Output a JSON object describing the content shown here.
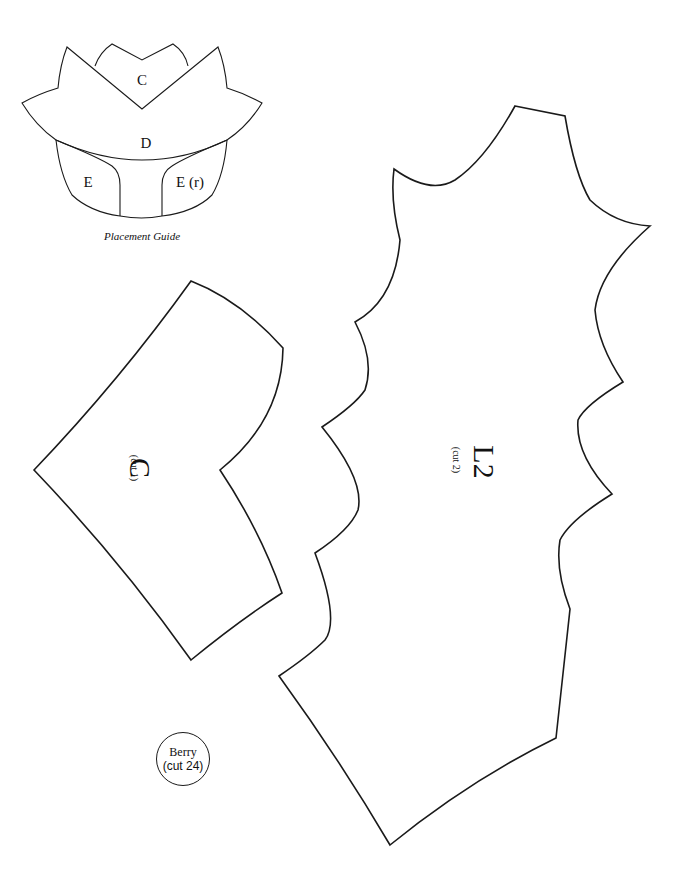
{
  "placement_guide": {
    "caption": "Placement Guide",
    "labels": {
      "c": "C",
      "d": "D",
      "e": "E",
      "e_reversed": "E (r)"
    }
  },
  "pieces": {
    "c": {
      "letter": "C",
      "cut": "(cut 1)"
    },
    "l2": {
      "letter": "L2",
      "cut": "(cut 2)"
    },
    "berry": {
      "name": "Berry",
      "cut": "(cut 24)"
    }
  },
  "colors": {
    "line": "#1a1a1a",
    "background": "#ffffff"
  }
}
